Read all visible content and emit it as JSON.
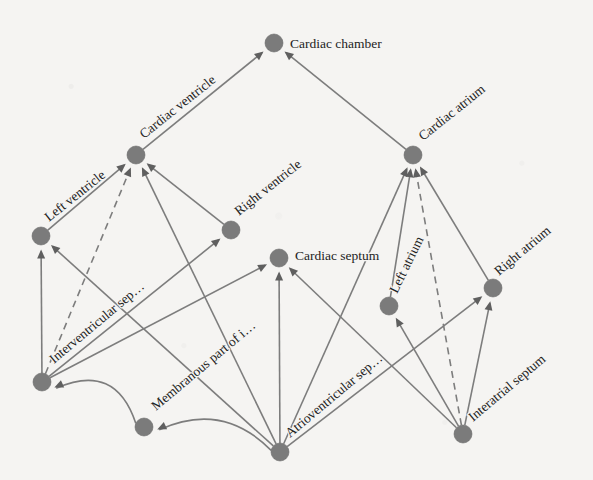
{
  "diagram": {
    "type": "directed-graph",
    "background_color": "#f5f4f2",
    "node_color": "#7b7b7b",
    "edge_color": "#7d7d7d",
    "label_color": "#232323",
    "node_radius": 9,
    "width": 593,
    "height": 480,
    "nodes": [
      {
        "id": "cardiac_chamber",
        "label": "Cardiac chamber",
        "x": 274,
        "y": 43,
        "label_dx": 16,
        "label_dy": 5,
        "label_rotate": 0,
        "label_anchor": "start"
      },
      {
        "id": "cardiac_ventricle",
        "label": "Cardiac ventricle",
        "x": 136,
        "y": 155,
        "label_dx": 8,
        "label_dy": -16,
        "label_rotate": -38.5,
        "label_anchor": "start"
      },
      {
        "id": "cardiac_atrium",
        "label": "Cardiac atrium",
        "x": 413,
        "y": 155,
        "label_dx": 10,
        "label_dy": -14,
        "label_rotate": -38.5,
        "label_anchor": "start"
      },
      {
        "id": "left_ventricle",
        "label": "Left ventricle",
        "x": 41,
        "y": 236,
        "label_dx": 8,
        "label_dy": -14,
        "label_rotate": -38.5,
        "label_anchor": "start"
      },
      {
        "id": "right_ventricle",
        "label": "Right ventricle",
        "x": 231,
        "y": 230,
        "label_dx": 8,
        "label_dy": -14,
        "label_rotate": -38.5,
        "label_anchor": "start"
      },
      {
        "id": "cardiac_septum",
        "label": "Cardiac septum",
        "x": 279,
        "y": 258,
        "label_dx": 16,
        "label_dy": 2,
        "label_rotate": 0,
        "label_anchor": "start"
      },
      {
        "id": "left_atrium",
        "label": "Left atrium",
        "x": 389,
        "y": 306,
        "label_dx": 8,
        "label_dy": -12,
        "label_rotate": -64,
        "label_anchor": "start"
      },
      {
        "id": "right_atrium",
        "label": "Right atrium",
        "x": 493,
        "y": 288,
        "label_dx": 6,
        "label_dy": -12,
        "label_rotate": -40,
        "label_anchor": "start"
      },
      {
        "id": "interventricular_septum",
        "label": "Interventricular sep…",
        "x": 42,
        "y": 382,
        "label_dx": 12,
        "label_dy": -18,
        "label_rotate": -40,
        "label_anchor": "start"
      },
      {
        "id": "membranous_part",
        "label": "Membranous part of i…",
        "x": 144,
        "y": 427,
        "label_dx": 12,
        "label_dy": -16,
        "label_rotate": -40,
        "label_anchor": "start"
      },
      {
        "id": "atrioventricular_septum",
        "label": "Atrioventricular sep…",
        "x": 280,
        "y": 452,
        "label_dx": 10,
        "label_dy": -14,
        "label_rotate": -40,
        "label_anchor": "start"
      },
      {
        "id": "interatrial_septum",
        "label": "Interatrial septum",
        "x": 463,
        "y": 434,
        "label_dx": 10,
        "label_dy": -12,
        "label_rotate": -40,
        "label_anchor": "start"
      }
    ],
    "edges": [
      {
        "from": "cardiac_ventricle",
        "to": "cardiac_chamber",
        "style": "solid",
        "curve": 0
      },
      {
        "from": "cardiac_atrium",
        "to": "cardiac_chamber",
        "style": "solid",
        "curve": 0
      },
      {
        "from": "left_ventricle",
        "to": "cardiac_ventricle",
        "style": "solid",
        "curve": 0
      },
      {
        "from": "right_ventricle",
        "to": "cardiac_ventricle",
        "style": "solid",
        "curve": 0
      },
      {
        "from": "interventricular_septum",
        "to": "cardiac_ventricle",
        "style": "dashed",
        "curve": 0
      },
      {
        "from": "atrioventricular_septum",
        "to": "cardiac_ventricle",
        "style": "solid",
        "curve": 0
      },
      {
        "from": "left_atrium",
        "to": "cardiac_atrium",
        "style": "solid",
        "curve": 0
      },
      {
        "from": "right_atrium",
        "to": "cardiac_atrium",
        "style": "solid",
        "curve": 0
      },
      {
        "from": "interatrial_septum",
        "to": "cardiac_atrium",
        "style": "dashed",
        "curve": 0
      },
      {
        "from": "atrioventricular_septum",
        "to": "cardiac_atrium",
        "style": "solid",
        "curve": 0
      },
      {
        "from": "interventricular_septum",
        "to": "left_ventricle",
        "style": "solid",
        "curve": 0
      },
      {
        "from": "atrioventricular_septum",
        "to": "left_ventricle",
        "style": "solid",
        "curve": 0
      },
      {
        "from": "interventricular_septum",
        "to": "right_ventricle",
        "style": "solid",
        "curve": 0
      },
      {
        "from": "interventricular_septum",
        "to": "cardiac_septum",
        "style": "solid",
        "curve": 0
      },
      {
        "from": "atrioventricular_septum",
        "to": "cardiac_septum",
        "style": "solid",
        "curve": 0
      },
      {
        "from": "interatrial_septum",
        "to": "cardiac_septum",
        "style": "solid",
        "curve": 0
      },
      {
        "from": "interatrial_septum",
        "to": "left_atrium",
        "style": "solid",
        "curve": 0
      },
      {
        "from": "atrioventricular_septum",
        "to": "right_atrium",
        "style": "solid",
        "curve": 0
      },
      {
        "from": "interatrial_septum",
        "to": "right_atrium",
        "style": "solid",
        "curve": 0
      },
      {
        "from": "membranous_part",
        "to": "interventricular_septum",
        "style": "solid",
        "curve": 48
      },
      {
        "from": "atrioventricular_septum",
        "to": "membranous_part",
        "style": "solid",
        "curve": 40
      }
    ]
  }
}
